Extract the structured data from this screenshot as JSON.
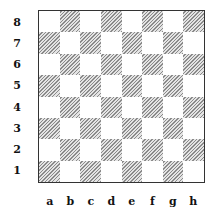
{
  "board": {
    "files": [
      "a",
      "b",
      "c",
      "d",
      "e",
      "f",
      "g",
      "h"
    ],
    "ranks": [
      "8",
      "7",
      "6",
      "5",
      "4",
      "3",
      "2",
      "1"
    ],
    "light_square_color": "#ffffff",
    "dark_square_pattern": "diagonal-hatch",
    "dark_hatch_color": "#8a8a8a",
    "border_color": "#333333",
    "pieces": []
  }
}
